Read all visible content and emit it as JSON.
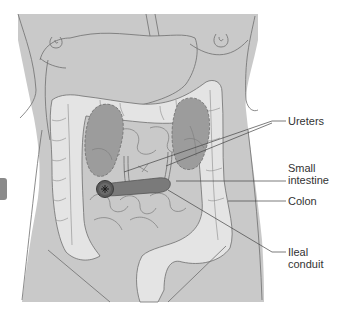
{
  "diagram": {
    "type": "anatomical illustration",
    "colors": {
      "body": "#c9c9c9",
      "body_outline": "#6e6e6e",
      "colon": "#e4e4e4",
      "kidney": "#9c9c9c",
      "conduit": "#7a7a7a",
      "stoma": "#5a5a5a",
      "leader_line": "#444444",
      "label_text": "#333333",
      "side_tab": "#8a8a8a"
    },
    "labels": [
      {
        "id": "ureters",
        "lines": [
          "Ureters"
        ]
      },
      {
        "id": "small-intestine",
        "lines": [
          "Small",
          "intestine"
        ]
      },
      {
        "id": "colon",
        "lines": [
          "Colon"
        ]
      },
      {
        "id": "ileal-conduit",
        "lines": [
          "Ileal",
          "conduit"
        ]
      }
    ]
  }
}
